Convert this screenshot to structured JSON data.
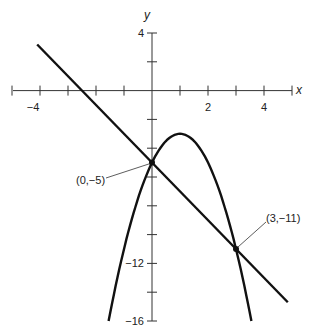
{
  "chart_data": {
    "type": "line",
    "title": "",
    "xlabel": "x",
    "ylabel": "y",
    "xlim": [
      -5,
      5
    ],
    "ylim": [
      -16,
      4
    ],
    "x_ticks": [
      -5,
      -4,
      -3,
      -2,
      -1,
      0,
      1,
      2,
      3,
      4,
      5
    ],
    "x_tick_labels": {
      "-4": "−4",
      "2": "2",
      "4": "4"
    },
    "y_ticks": [
      4,
      2,
      0,
      -2,
      -4,
      -6,
      -8,
      -10,
      -12,
      -14,
      -16
    ],
    "y_tick_labels": {
      "4": "4",
      "-12": "−12",
      "-16": "−16"
    },
    "grid": false,
    "series": [
      {
        "name": "line",
        "equation": "y = -2x - 5",
        "x_range": [
          -4.1,
          4.85
        ]
      },
      {
        "name": "parabola",
        "equation": "y = -2x^2 + 4x - 5",
        "x_range": [
          -1.55,
          3.55
        ],
        "vertex": [
          1,
          -3
        ]
      }
    ],
    "annotations": [
      {
        "text": "(0,−5)",
        "point": [
          0,
          -5
        ]
      },
      {
        "text": "(3,−11)",
        "point": [
          3,
          -11
        ]
      }
    ]
  },
  "labels": {
    "x_axis": "x",
    "y_axis": "y",
    "xt_m4": "−4",
    "xt_2": "2",
    "xt_4": "4",
    "yt_4": "4",
    "yt_m12": "−12",
    "yt_m16": "−16",
    "pt1": "(0,−5)",
    "pt2": "(3,−11)"
  }
}
